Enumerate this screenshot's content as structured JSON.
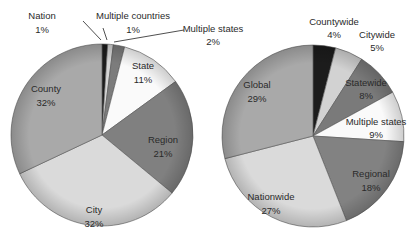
{
  "chart_data": [
    {
      "type": "pie",
      "title": "",
      "center": [
        102,
        135
      ],
      "radius": 91,
      "start_angle_deg": 0,
      "direction": "clockwise",
      "slices": [
        {
          "label": "Nation",
          "value": 1,
          "color": "#1c1c1c",
          "label_pos": [
            42,
            19
          ],
          "pct_pos": [
            42,
            33
          ],
          "leader": [
            [
              83,
              21
            ],
            [
              101,
              40
            ]
          ]
        },
        {
          "label": "Multiple countries",
          "value": 1,
          "color": "#d6d6d6",
          "label_pos": [
            133,
            19
          ],
          "pct_pos": [
            133,
            33
          ],
          "leader": [
            [
              103,
              28
            ],
            [
              107,
              40
            ]
          ]
        },
        {
          "label": "Multiple states",
          "value": 2,
          "color": "#7c7c7c",
          "label_pos": [
            213,
            32
          ],
          "pct_pos": [
            213,
            45
          ],
          "leader": [
            [
              184,
              30
            ],
            [
              114,
              42
            ]
          ]
        },
        {
          "label": "State",
          "value": 11,
          "color": "#fafafa",
          "label_pos": [
            143,
            69
          ],
          "pct_pos": [
            143,
            83
          ]
        },
        {
          "label": "Region",
          "value": 21,
          "color": "#808080",
          "label_pos": [
            163,
            143
          ],
          "pct_pos": [
            163,
            157
          ]
        },
        {
          "label": "City",
          "value": 32,
          "color": "#dadada",
          "label_pos": [
            94,
            213
          ],
          "pct_pos": [
            94,
            227
          ]
        },
        {
          "label": "County",
          "value": 32,
          "color": "#a9a9a9",
          "label_pos": [
            46,
            92
          ],
          "pct_pos": [
            46,
            106
          ]
        }
      ]
    },
    {
      "type": "pie",
      "title": "",
      "center": [
        313,
        136
      ],
      "radius": 91,
      "start_angle_deg": 0,
      "direction": "clockwise",
      "slices": [
        {
          "label": "Countywide",
          "value": 4,
          "color": "#1c1c1c",
          "label_pos": [
            334,
            25
          ],
          "pct_pos": [
            334,
            38
          ]
        },
        {
          "label": "Citywide",
          "value": 5,
          "color": "#d2d2d2",
          "label_pos": [
            377,
            38
          ],
          "pct_pos": [
            377,
            51
          ]
        },
        {
          "label": "Statewide",
          "value": 8,
          "color": "#7a7a7a",
          "label_pos": [
            366,
            86
          ],
          "pct_pos": [
            366,
            99
          ]
        },
        {
          "label": "Multiple states",
          "value": 9,
          "color": "#fafafa",
          "label_pos": [
            376,
            125
          ],
          "pct_pos": [
            376,
            138
          ]
        },
        {
          "label": "Regional",
          "value": 18,
          "color": "#828282",
          "label_pos": [
            371,
            177
          ],
          "pct_pos": [
            371,
            191
          ]
        },
        {
          "label": "Nationwide",
          "value": 27,
          "color": "#dadada",
          "label_pos": [
            271,
            200
          ],
          "pct_pos": [
            271,
            214
          ]
        },
        {
          "label": "Global",
          "value": 29,
          "color": "#a9a9a9",
          "label_pos": [
            257,
            88
          ],
          "pct_pos": [
            257,
            102
          ]
        }
      ]
    }
  ]
}
